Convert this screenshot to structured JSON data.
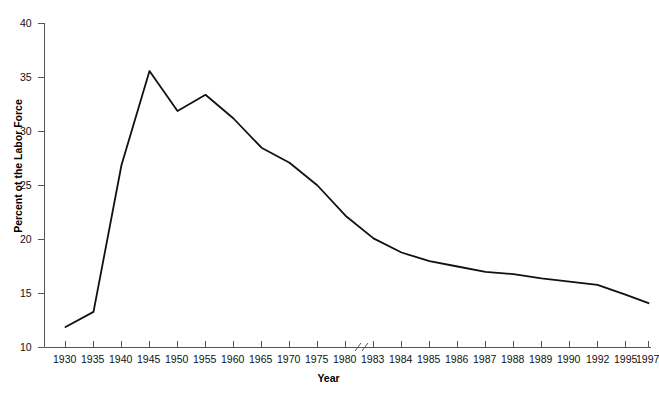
{
  "chart_data": {
    "type": "line",
    "title": "",
    "subtitle": "",
    "xlabel": "Year",
    "ylabel": "Percent ot the Labor Force",
    "categories": [
      "1930",
      "1935",
      "1940",
      "1945",
      "1950",
      "1955",
      "1960",
      "1965",
      "1970",
      "1975",
      "1980",
      "1983",
      "1984",
      "1985",
      "1986",
      "1987",
      "1988",
      "1989",
      "1990",
      "1992",
      "1995",
      "1997"
    ],
    "values": [
      11.9,
      13.3,
      26.9,
      35.6,
      31.9,
      33.4,
      31.2,
      28.5,
      27.1,
      25.0,
      22.2,
      20.1,
      18.8,
      18.0,
      17.5,
      17.0,
      16.8,
      16.4,
      16.1,
      15.8,
      14.9,
      14.1
    ],
    "series": [
      {
        "name": "Percent of the Labor Force",
        "values": [
          11.9,
          13.3,
          26.9,
          35.6,
          31.9,
          33.4,
          31.2,
          28.5,
          27.1,
          25.0,
          22.2,
          20.1,
          18.8,
          18.0,
          17.5,
          17.0,
          16.8,
          16.4,
          16.1,
          15.8,
          14.9,
          14.1
        ]
      }
    ],
    "yticks": [
      10,
      15,
      20,
      25,
      30,
      35,
      40
    ],
    "ytick_labels": [
      "10",
      "15",
      "20",
      "25",
      "30",
      "35",
      "40"
    ],
    "ylim": [
      10,
      40
    ],
    "grid": false,
    "legend": false,
    "legend_position": "none",
    "line_color": "#111111",
    "line_width": 1.8,
    "background_color": "#ffffff",
    "axis_color": "#555555",
    "axis_break": {
      "present": true,
      "between": [
        "1980",
        "1983"
      ]
    },
    "annotations": []
  }
}
